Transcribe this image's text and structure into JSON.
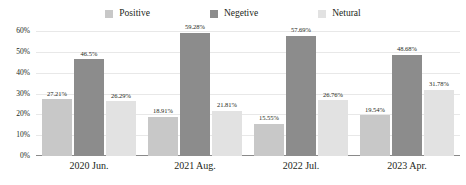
{
  "chart_data": {
    "type": "bar",
    "title": "",
    "xlabel": "",
    "ylabel": "",
    "ylim": [
      0,
      60
    ],
    "ytick_labels": [
      "0%",
      "10%",
      "20%",
      "30%",
      "40%",
      "50%",
      "60%"
    ],
    "ytick_values": [
      0,
      10,
      20,
      30,
      40,
      50,
      60
    ],
    "grid": true,
    "legend_position": "top-center",
    "categories": [
      "2020 Jun.",
      "2021 Aug.",
      "2022 Jul.",
      "2023 Apr."
    ],
    "series": [
      {
        "name": "Positive",
        "color": "#c8c8c8",
        "values": [
          27.21,
          18.91,
          15.55,
          19.54
        ],
        "labels": [
          "27.21%",
          "18.91%",
          "15.55%",
          "19.54%"
        ]
      },
      {
        "name": "Negetive",
        "color": "#8c8c8c",
        "values": [
          46.5,
          59.28,
          57.69,
          48.68
        ],
        "labels": [
          "46.5%",
          "59.28%",
          "57.69%",
          "48.68%"
        ]
      },
      {
        "name": "Netural",
        "color": "#e2e2e2",
        "values": [
          26.29,
          21.81,
          26.76,
          31.78
        ],
        "labels": [
          "26.29%",
          "21.81%",
          "26.76%",
          "31.78%"
        ]
      }
    ]
  },
  "colors": {
    "positive": "#c8c8c8",
    "negetive": "#8c8c8c",
    "netural": "#e2e2e2",
    "gridline": "#e8e8e8",
    "baseline": "#8a8a8a",
    "text": "#231f20",
    "background": "#ffffff"
  }
}
